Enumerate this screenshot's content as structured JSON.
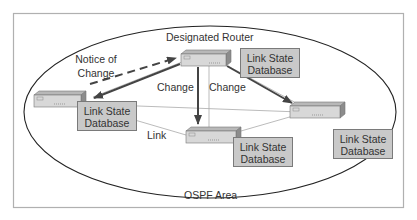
{
  "diagram": {
    "title": "OSPF Area",
    "colors": {
      "frame": "#b0b0b0",
      "ellipse": "#222222",
      "arrow": "#444444",
      "link": "#aaaaaa",
      "db_fill": "#c9c9c9",
      "router_top": "#b8b8b8",
      "router_front": "#d8d8d8",
      "router_side": "#8c8c8c"
    },
    "labels": {
      "designated_router": "Designated Router",
      "notice_of_change_line1": "Notice of",
      "notice_of_change_line2": "Change",
      "change_left": "Change",
      "change_right": "Change",
      "link": "Link",
      "area": "OSPF Area"
    },
    "databases": [
      {
        "line1": "Link State",
        "line2": "Database",
        "attached_to": "designated-router"
      },
      {
        "line1": "Link State",
        "line2": "Database",
        "attached_to": "router-left"
      },
      {
        "line1": "Link State",
        "line2": "Database",
        "attached_to": "router-bottom"
      },
      {
        "line1": "Link State",
        "line2": "Database",
        "attached_to": "router-right"
      }
    ],
    "routers": [
      {
        "id": "designated-router"
      },
      {
        "id": "router-left"
      },
      {
        "id": "router-bottom"
      },
      {
        "id": "router-right"
      }
    ]
  }
}
